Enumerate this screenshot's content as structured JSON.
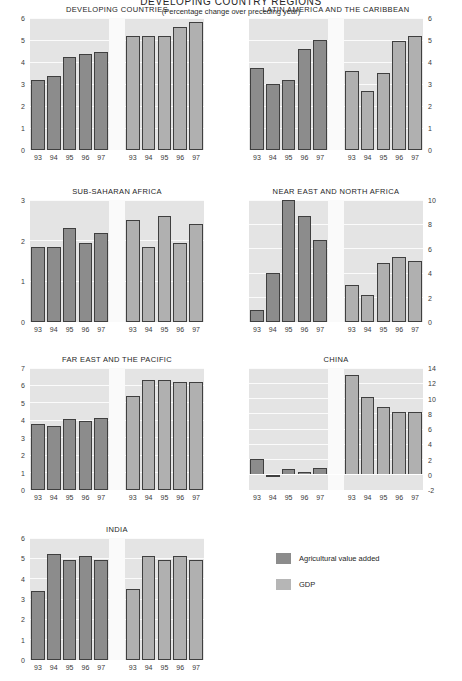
{
  "chart_data": {
    "type": "bar",
    "title": "DEVELOPING COUNTRY REGIONS",
    "subtitle": "(Percentage change over preceding year)",
    "xlabel": "",
    "ylabel": "",
    "grid": true,
    "legend_position": "bottom-right",
    "categories": [
      "93",
      "94",
      "95",
      "96",
      "97"
    ],
    "legend": [
      {
        "name": "Agricultural value added",
        "color": "#8c8c8c"
      },
      {
        "name": "GDP",
        "color": "#b6b6b6"
      }
    ],
    "panels": [
      {
        "title": "DEVELOPING COUNTRIES",
        "ylim": [
          0,
          6
        ],
        "yticks": [
          0,
          1,
          2,
          3,
          4,
          5,
          6
        ],
        "axis_side": "left",
        "series": [
          {
            "name": "Agricultural value added",
            "values": [
              3.2,
              3.35,
              4.25,
              4.35,
              4.45
            ]
          },
          {
            "name": "GDP",
            "values": [
              5.2,
              5.2,
              5.2,
              5.6,
              5.8
            ]
          }
        ]
      },
      {
        "title": "LATIN AMERICA AND THE CARIBBEAN",
        "ylim": [
          0,
          6
        ],
        "yticks": [
          0,
          1,
          2,
          3,
          4,
          5,
          6
        ],
        "axis_side": "right",
        "series": [
          {
            "name": "Agricultural value added",
            "values": [
              3.75,
              3.0,
              3.2,
              4.6,
              5.0
            ]
          },
          {
            "name": "GDP",
            "values": [
              3.6,
              2.7,
              3.5,
              4.95,
              5.2
            ]
          }
        ]
      },
      {
        "title": "SUB-SAHARAN AFRICA",
        "ylim": [
          0,
          3
        ],
        "yticks": [
          0,
          1,
          2,
          3
        ],
        "axis_side": "left",
        "series": [
          {
            "name": "Agricultural value added",
            "values": [
              1.85,
              1.85,
              2.3,
              1.95,
              2.2
            ]
          },
          {
            "name": "GDP",
            "values": [
              2.5,
              1.85,
              2.6,
              1.95,
              2.4
            ]
          }
        ]
      },
      {
        "title": "NEAR EAST AND NORTH AFRICA",
        "ylim": [
          0,
          10
        ],
        "yticks": [
          0,
          2,
          4,
          6,
          8,
          10
        ],
        "axis_side": "right",
        "series": [
          {
            "name": "Agricultural value added",
            "values": [
              1.0,
              4.0,
              10.0,
              8.7,
              6.7
            ]
          },
          {
            "name": "GDP",
            "values": [
              3.0,
              2.2,
              4.8,
              5.3,
              5.0
            ]
          }
        ]
      },
      {
        "title": "FAR EAST AND THE PACIFIC",
        "ylim": [
          0,
          7
        ],
        "yticks": [
          0,
          1,
          2,
          3,
          4,
          5,
          6,
          7
        ],
        "axis_side": "left",
        "series": [
          {
            "name": "Agricultural value added",
            "values": [
              3.8,
              3.7,
              4.05,
              3.95,
              4.15
            ]
          },
          {
            "name": "GDP",
            "values": [
              5.4,
              6.3,
              6.3,
              6.2,
              6.2
            ]
          }
        ]
      },
      {
        "title": "CHINA",
        "ylim": [
          -2,
          14
        ],
        "yticks": [
          -2,
          0,
          2,
          4,
          6,
          8,
          10,
          12,
          14
        ],
        "axis_side": "right",
        "series": [
          {
            "name": "Agricultural value added",
            "values": [
              2.1,
              -0.1,
              0.7,
              0.3,
              0.9
            ]
          },
          {
            "name": "GDP",
            "values": [
              13.1,
              10.2,
              8.9,
              8.2,
              8.2
            ]
          }
        ]
      },
      {
        "title": "INDIA",
        "ylim": [
          0,
          6
        ],
        "yticks": [
          0,
          1,
          2,
          3,
          4,
          5,
          6
        ],
        "axis_side": "left",
        "series": [
          {
            "name": "Agricultural value added",
            "values": [
              3.4,
              5.2,
              4.9,
              5.1,
              4.9
            ]
          },
          {
            "name": "GDP",
            "values": [
              3.5,
              5.1,
              4.9,
              5.1,
              4.9
            ]
          }
        ]
      }
    ]
  }
}
